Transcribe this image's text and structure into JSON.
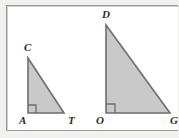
{
  "figure": {
    "frame": {
      "border_color": "#9b9b9b",
      "background": "#ffffff",
      "page_background": "#f2f1ef"
    },
    "style": {
      "fill_color": "#c9c9c9",
      "stroke_color": "#6e6e6e",
      "label_color": "#2b2b2b",
      "stroke_width": "1.6"
    },
    "triangles": [
      {
        "id": "triangle-cat",
        "name": "triangle-CAT",
        "vertices": [
          {
            "label": "C",
            "role": "apex",
            "x": 28,
            "y": 58,
            "label_x": 24,
            "label_y": 42
          },
          {
            "label": "A",
            "role": "right-angle",
            "x": 28,
            "y": 113,
            "label_x": 19,
            "label_y": 115
          },
          {
            "label": "T",
            "role": "base-right",
            "x": 64,
            "y": 113,
            "label_x": 68,
            "label_y": 115
          }
        ],
        "right_angle_at": "A",
        "right_angle_marker_size": 8,
        "legs": {
          "vertical": 55,
          "horizontal": 36
        }
      },
      {
        "id": "triangle-dog",
        "name": "triangle-DOG",
        "vertices": [
          {
            "label": "D",
            "role": "apex",
            "x": 106,
            "y": 25,
            "label_x": 102,
            "label_y": 9
          },
          {
            "label": "O",
            "role": "right-angle",
            "x": 106,
            "y": 113,
            "label_x": 96,
            "label_y": 115
          },
          {
            "label": "G",
            "role": "base-right",
            "x": 170,
            "y": 113,
            "label_x": 170,
            "label_y": 115
          }
        ],
        "right_angle_at": "O",
        "right_angle_marker_size": 9,
        "legs": {
          "vertical": 88,
          "horizontal": 64
        }
      }
    ],
    "labels": {
      "C": "C",
      "A": "A",
      "T": "T",
      "D": "D",
      "O": "O",
      "G": "G"
    }
  }
}
